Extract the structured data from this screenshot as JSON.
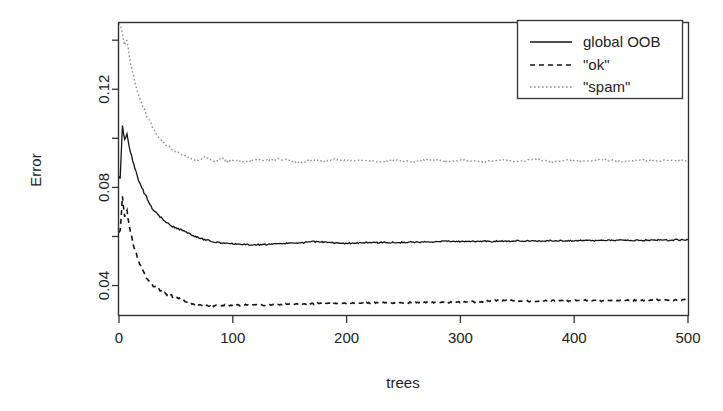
{
  "chart_data": {
    "type": "line",
    "title": "",
    "xlabel": "trees",
    "ylabel": "Error",
    "xlim": [
      0,
      500
    ],
    "ylim": [
      0.028,
      0.147
    ],
    "grid": false,
    "legend_position": "top-right",
    "xticks": [
      0,
      100,
      200,
      300,
      400,
      500
    ],
    "xtick_labels": [
      "0",
      "100",
      "200",
      "300",
      "400",
      "500"
    ],
    "yticks": [
      0.04,
      0.06,
      0.08,
      0.1,
      0.12,
      0.14
    ],
    "ytick_labels": [
      "0.04",
      "",
      "0.08",
      "",
      "0.12",
      ""
    ],
    "series": [
      {
        "name": "global OOB",
        "style": "solid",
        "color": "#141414",
        "x": [
          1,
          3,
          5,
          7,
          9,
          11,
          13,
          15,
          18,
          21,
          24,
          27,
          30,
          34,
          38,
          42,
          46,
          50,
          55,
          60,
          65,
          70,
          75,
          80,
          85,
          90,
          95,
          100,
          110,
          120,
          130,
          140,
          150,
          160,
          170,
          180,
          190,
          200,
          215,
          230,
          245,
          260,
          275,
          290,
          305,
          320,
          335,
          350,
          365,
          380,
          395,
          410,
          425,
          440,
          455,
          470,
          485,
          500
        ],
        "values": [
          0.084,
          0.105,
          0.099,
          0.102,
          0.096,
          0.093,
          0.089,
          0.086,
          0.082,
          0.079,
          0.076,
          0.073,
          0.071,
          0.069,
          0.067,
          0.0655,
          0.0645,
          0.0635,
          0.0625,
          0.0615,
          0.0605,
          0.0595,
          0.0588,
          0.0582,
          0.0578,
          0.0575,
          0.0572,
          0.057,
          0.0568,
          0.0566,
          0.0568,
          0.057,
          0.0572,
          0.0574,
          0.058,
          0.0576,
          0.0574,
          0.0572,
          0.0574,
          0.0576,
          0.0575,
          0.0577,
          0.0578,
          0.058,
          0.0579,
          0.0581,
          0.058,
          0.0582,
          0.0581,
          0.0583,
          0.0582,
          0.0584,
          0.0583,
          0.0585,
          0.0584,
          0.0586,
          0.0585,
          0.0587
        ]
      },
      {
        "name": "\"ok\"",
        "style": "dashed",
        "color": "#141414",
        "x": [
          1,
          3,
          5,
          7,
          9,
          11,
          13,
          15,
          18,
          21,
          24,
          27,
          30,
          34,
          38,
          42,
          46,
          50,
          55,
          60,
          65,
          70,
          75,
          80,
          85,
          90,
          95,
          100,
          110,
          120,
          130,
          140,
          150,
          160,
          170,
          180,
          190,
          200,
          215,
          230,
          245,
          260,
          275,
          290,
          305,
          320,
          335,
          350,
          365,
          380,
          395,
          410,
          425,
          440,
          455,
          470,
          485,
          500
        ],
        "values": [
          0.062,
          0.076,
          0.068,
          0.071,
          0.064,
          0.06,
          0.056,
          0.053,
          0.049,
          0.046,
          0.0435,
          0.0415,
          0.04,
          0.0385,
          0.0375,
          0.0365,
          0.0358,
          0.0352,
          0.0342,
          0.0332,
          0.0325,
          0.032,
          0.0318,
          0.0316,
          0.0318,
          0.032,
          0.0319,
          0.0321,
          0.032,
          0.0322,
          0.0321,
          0.0323,
          0.0325,
          0.0324,
          0.0326,
          0.0327,
          0.0326,
          0.0328,
          0.0329,
          0.033,
          0.0329,
          0.0331,
          0.0332,
          0.0331,
          0.0333,
          0.0334,
          0.034,
          0.0338,
          0.0336,
          0.0337,
          0.0338,
          0.0339,
          0.0338,
          0.034,
          0.0339,
          0.0341,
          0.034,
          0.0342
        ]
      },
      {
        "name": "\"spam\"",
        "style": "dotted",
        "color": "#8c8c8c",
        "x": [
          1,
          3,
          5,
          7,
          9,
          11,
          13,
          15,
          18,
          21,
          24,
          27,
          30,
          34,
          38,
          42,
          46,
          50,
          55,
          60,
          65,
          70,
          75,
          80,
          85,
          90,
          95,
          100,
          110,
          120,
          130,
          140,
          150,
          160,
          170,
          180,
          190,
          200,
          215,
          230,
          245,
          260,
          275,
          290,
          305,
          320,
          335,
          350,
          365,
          380,
          395,
          410,
          425,
          440,
          455,
          470,
          485,
          500
        ],
        "values": [
          0.147,
          0.143,
          0.138,
          0.14,
          0.134,
          0.129,
          0.125,
          0.121,
          0.117,
          0.113,
          0.11,
          0.107,
          0.104,
          0.101,
          0.099,
          0.097,
          0.0955,
          0.0945,
          0.0935,
          0.0925,
          0.0915,
          0.0908,
          0.0925,
          0.0912,
          0.0905,
          0.0918,
          0.0908,
          0.0912,
          0.0905,
          0.0915,
          0.0908,
          0.0918,
          0.091,
          0.0902,
          0.0912,
          0.0905,
          0.0915,
          0.0908,
          0.0912,
          0.0902,
          0.091,
          0.0905,
          0.0915,
          0.0906,
          0.0912,
          0.0904,
          0.091,
          0.0906,
          0.0914,
          0.0905,
          0.0911,
          0.0907,
          0.0913,
          0.0906,
          0.091,
          0.0908,
          0.0912,
          0.0908
        ]
      }
    ]
  },
  "legend": {
    "entries": [
      {
        "label": "global OOB",
        "style": "solid"
      },
      {
        "label": "\"ok\"",
        "style": "dashed"
      },
      {
        "label": "\"spam\"",
        "style": "dotted"
      }
    ]
  },
  "colors": {
    "background": "#ffffff",
    "frame": "#333333",
    "ink": "#141414",
    "muted": "#8c8c8c"
  }
}
